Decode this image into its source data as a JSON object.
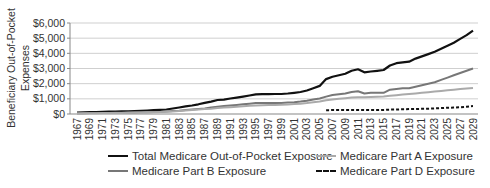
{
  "chart_data": {
    "type": "line",
    "title": "",
    "xlabel": "",
    "ylabel": "Beneficiary Out-of-Pocket Expenses",
    "ylim": [
      0,
      6000
    ],
    "yticks": [
      "$0",
      "$1,000",
      "$2,000",
      "$3,000",
      "$4,000",
      "$5,000",
      "$6,000"
    ],
    "grid": true,
    "legend_position": "bottom",
    "x": [
      1967,
      1968,
      1969,
      1970,
      1971,
      1972,
      1973,
      1974,
      1975,
      1976,
      1977,
      1978,
      1979,
      1980,
      1981,
      1982,
      1983,
      1984,
      1985,
      1986,
      1987,
      1988,
      1989,
      1990,
      1991,
      1992,
      1993,
      1994,
      1995,
      1996,
      1997,
      1998,
      1999,
      2000,
      2001,
      2002,
      2003,
      2004,
      2005,
      2006,
      2007,
      2008,
      2009,
      2010,
      2011,
      2012,
      2013,
      2014,
      2015,
      2016,
      2017,
      2018,
      2019,
      2020,
      2021,
      2022,
      2023,
      2024,
      2025,
      2026,
      2027,
      2028,
      2029
    ],
    "xtick_labels": [
      "1967",
      "1969",
      "1971",
      "1973",
      "1975",
      "1977",
      "1979",
      "1981",
      "1983",
      "1985",
      "1987",
      "1989",
      "1991",
      "1993",
      "1995",
      "1997",
      "1999",
      "2001",
      "2003",
      "2005",
      "2007",
      "2009",
      "2011",
      "2013",
      "2015",
      "2017",
      "2019",
      "2021",
      "2023",
      "2025",
      "2027",
      "2029"
    ],
    "series": [
      {
        "name": "Total Medicare Out-of-Pocket Exposure",
        "color": "#111111",
        "dash": "solid",
        "values": [
          100,
          110,
          120,
          130,
          140,
          150,
          160,
          170,
          180,
          190,
          210,
          230,
          250,
          270,
          300,
          360,
          430,
          500,
          560,
          640,
          730,
          820,
          920,
          950,
          1020,
          1080,
          1150,
          1220,
          1300,
          1310,
          1310,
          1320,
          1320,
          1350,
          1400,
          1450,
          1550,
          1700,
          1850,
          2300,
          2450,
          2550,
          2650,
          2850,
          2950,
          2750,
          2800,
          2850,
          2900,
          3200,
          3350,
          3400,
          3450,
          3650,
          3800,
          3950,
          4100,
          4300,
          4500,
          4700,
          4950,
          5200,
          5500
        ]
      },
      {
        "name": "Medicare Part B Exposure",
        "color": "#777777",
        "dash": "solid",
        "values": [
          50,
          55,
          60,
          65,
          70,
          75,
          80,
          85,
          90,
          100,
          110,
          120,
          130,
          140,
          160,
          190,
          220,
          260,
          290,
          330,
          370,
          420,
          480,
          520,
          560,
          600,
          640,
          680,
          720,
          720,
          720,
          720,
          730,
          750,
          780,
          820,
          880,
          950,
          1020,
          1150,
          1250,
          1300,
          1350,
          1450,
          1500,
          1350,
          1400,
          1400,
          1400,
          1600,
          1650,
          1700,
          1700,
          1800,
          1900,
          2000,
          2100,
          2250,
          2400,
          2550,
          2700,
          2850,
          3000
        ]
      },
      {
        "name": "Medicare Part A Exposure",
        "color": "#aaaaaa",
        "dash": "solid",
        "values": [
          40,
          45,
          50,
          55,
          60,
          65,
          70,
          75,
          80,
          90,
          100,
          110,
          120,
          130,
          150,
          170,
          200,
          230,
          260,
          290,
          320,
          350,
          390,
          420,
          450,
          480,
          510,
          540,
          570,
          580,
          590,
          600,
          610,
          630,
          650,
          680,
          720,
          770,
          820,
          900,
          950,
          1000,
          1040,
          1080,
          1100,
          1100,
          1120,
          1140,
          1160,
          1200,
          1240,
          1280,
          1320,
          1360,
          1400,
          1440,
          1480,
          1520,
          1560,
          1600,
          1640,
          1680,
          1720
        ]
      },
      {
        "name": "Medicare Part D Exposure",
        "color": "#111111",
        "dash": "dashed",
        "values": [
          null,
          null,
          null,
          null,
          null,
          null,
          null,
          null,
          null,
          null,
          null,
          null,
          null,
          null,
          null,
          null,
          null,
          null,
          null,
          null,
          null,
          null,
          null,
          null,
          null,
          null,
          null,
          null,
          null,
          null,
          null,
          null,
          null,
          null,
          null,
          null,
          null,
          null,
          null,
          250,
          260,
          260,
          260,
          260,
          260,
          260,
          260,
          260,
          270,
          290,
          300,
          310,
          320,
          330,
          340,
          350,
          370,
          390,
          410,
          430,
          450,
          480,
          520
        ]
      }
    ]
  },
  "legend": {
    "items": [
      {
        "label": "Total Medicare Out-of-Pocket Exposure",
        "color": "#111111",
        "style": "solid"
      },
      {
        "label": "Medicare Part A Exposure",
        "color": "#aaaaaa",
        "style": "solid"
      },
      {
        "label": "Medicare Part B Exposure",
        "color": "#777777",
        "style": "solid"
      },
      {
        "label": "Medicare Part D Exposure",
        "color": "#111111",
        "style": "dashed"
      }
    ]
  }
}
